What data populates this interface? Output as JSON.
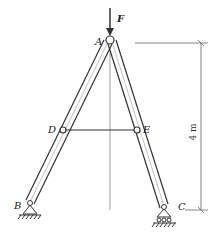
{
  "diagram": {
    "type": "truss-a-frame",
    "force": {
      "label": "F",
      "direction": "down",
      "at": "A"
    },
    "joints": [
      {
        "id": "A",
        "label": "A",
        "role": "apex pin"
      },
      {
        "id": "D",
        "label": "D",
        "role": "pin on left member"
      },
      {
        "id": "E",
        "label": "E",
        "role": "pin on right member"
      },
      {
        "id": "B",
        "label": "B",
        "role": "fixed pin support"
      },
      {
        "id": "C",
        "label": "C",
        "role": "roller support"
      }
    ],
    "members": [
      {
        "from": "A",
        "to": "B"
      },
      {
        "from": "A",
        "to": "C"
      },
      {
        "from": "D",
        "to": "E"
      }
    ],
    "dimension": {
      "label": "4 m",
      "from": "A",
      "to": "C",
      "orientation": "vertical"
    },
    "colors": {
      "line": "#333333",
      "thin": "#777777",
      "background": "#ffffff"
    }
  }
}
